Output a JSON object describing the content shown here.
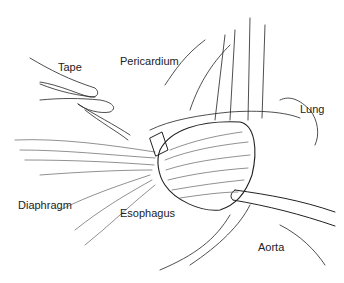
{
  "figure": {
    "labels": {
      "tape": "Tape",
      "pericardium": "Pericardium",
      "lung": "Lung",
      "diaphragm": "Diaphragm",
      "esophagus": "Esophagus",
      "aorta": "Aorta"
    },
    "colors": {
      "line": "#222222",
      "background": "#ffffff"
    }
  }
}
